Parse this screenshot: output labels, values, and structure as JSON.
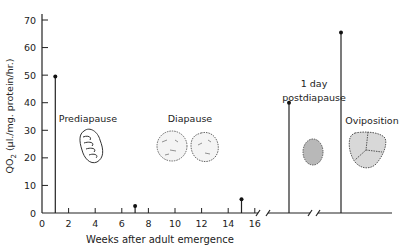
{
  "chart_data": {
    "type": "bar",
    "subtype": "stem",
    "title": "",
    "xlabel": "Weeks after adult emergence",
    "ylabel": "QO2 (µl./mg. protein/hr.)",
    "ylim": [
      0,
      70
    ],
    "yticks": [
      0,
      10,
      20,
      30,
      40,
      50,
      60,
      70
    ],
    "xticks": [
      0,
      2,
      4,
      6,
      8,
      10,
      12,
      14,
      16
    ],
    "grid": false,
    "legend": "none",
    "axis_breaks": [
      "after 16 weeks",
      "between postdiapause and oviposition"
    ],
    "series": [
      {
        "name": "QO2",
        "points": [
          {
            "x": 1,
            "label": "1 week",
            "value": 49.5
          },
          {
            "x": 7,
            "label": "7 weeks",
            "value": 2.5
          },
          {
            "x": 15,
            "label": "15 weeks",
            "value": 5
          },
          {
            "x": "1 day postdiapause",
            "label": "1 day postdiapause",
            "value": 40
          },
          {
            "x": "Oviposition",
            "label": "Oviposition",
            "value": 65.5
          }
        ]
      }
    ],
    "annotations": [
      {
        "text": "Prediapause",
        "near_x": 3
      },
      {
        "text": "Diapause",
        "near_x": 11
      },
      {
        "text": "1 day",
        "line2": "postdiapause"
      },
      {
        "text": "Oviposition"
      }
    ]
  },
  "labels": {
    "y_axis": "QO",
    "y_axis_sub": "2",
    "y_axis_rest": " (µl./mg. protein/hr.)",
    "x_axis": "Weeks after adult emergence",
    "prediapause": "Prediapause",
    "diapause": "Diapause",
    "postdiapause_l1": "1 day",
    "postdiapause_l2": "postdiapause",
    "oviposition": "Oviposition"
  },
  "ytick_labels": [
    "0",
    "10",
    "20",
    "30",
    "40",
    "50",
    "60",
    "70"
  ],
  "xtick_labels": [
    "0",
    "2",
    "4",
    "6",
    "8",
    "10",
    "12",
    "14",
    "16"
  ]
}
